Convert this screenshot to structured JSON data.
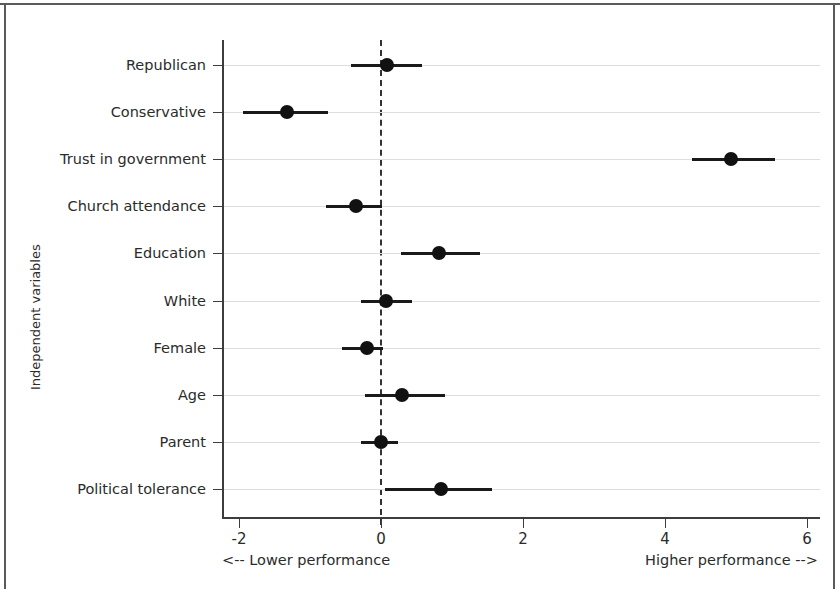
{
  "chart_data": {
    "type": "scatter",
    "subtype": "coefficient-plot-with-confidence-intervals",
    "title": "",
    "xlabel": "",
    "ylabel": "Independent variables",
    "xlim": [
      -2.6,
      6.4
    ],
    "xticks": [
      -2,
      0,
      2,
      4,
      6
    ],
    "xticklabels": [
      "-2",
      "0",
      "2",
      "4",
      "6"
    ],
    "grid": true,
    "grid_axis": "y",
    "reference_line": 0,
    "reference_line_style": "dashed",
    "legend": null,
    "categories": [
      "Republican",
      "Conservative",
      "Trust in government",
      "Church attendance",
      "Education",
      "White",
      "Female",
      "Age",
      "Parent",
      "Political tolerance"
    ],
    "points": [
      {
        "label": "Republican",
        "estimate": 0.08,
        "ci_low": -0.42,
        "ci_high": 0.58
      },
      {
        "label": "Conservative",
        "estimate": -1.32,
        "ci_low": -1.94,
        "ci_high": -0.75
      },
      {
        "label": "Trust in government",
        "estimate": 4.93,
        "ci_low": 4.38,
        "ci_high": 5.55
      },
      {
        "label": "Church attendance",
        "estimate": -0.35,
        "ci_low": -0.78,
        "ci_high": 0.02
      },
      {
        "label": "Education",
        "estimate": 0.82,
        "ci_low": 0.28,
        "ci_high": 1.4
      },
      {
        "label": "White",
        "estimate": 0.07,
        "ci_low": -0.28,
        "ci_high": 0.44
      },
      {
        "label": "Female",
        "estimate": -0.2,
        "ci_low": -0.55,
        "ci_high": 0.03
      },
      {
        "label": "Age",
        "estimate": 0.3,
        "ci_low": -0.22,
        "ci_high": 0.9
      },
      {
        "label": "Parent",
        "estimate": 0.0,
        "ci_low": -0.28,
        "ci_high": 0.24
      },
      {
        "label": "Political tolerance",
        "estimate": 0.85,
        "ci_low": 0.05,
        "ci_high": 1.57
      }
    ],
    "annotations": {
      "left": "<-- Lower performance",
      "right": "Higher performance -->"
    },
    "colors": {
      "point": "#111111",
      "interval": "#1a1a1a",
      "grid": "#dedede",
      "axis": "#3d3d3d",
      "background": "#ffffff"
    }
  },
  "axis": {
    "y_title": "Independent variables"
  },
  "footnotes": {
    "lower": "<-- Lower performance",
    "higher": "Higher performance -->"
  }
}
